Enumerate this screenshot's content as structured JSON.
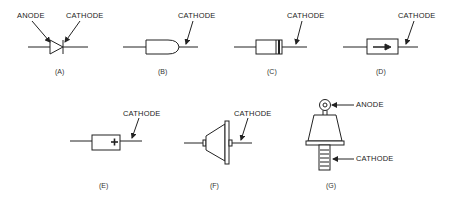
{
  "diagram": {
    "stroke_color": "#222222",
    "figures": [
      {
        "id": "A",
        "caption": "(A)",
        "labels": {
          "anode": "ANODE",
          "cathode": "CATHODE"
        },
        "kind": "schematic-symbol"
      },
      {
        "id": "B",
        "caption": "(B)",
        "labels": {
          "cathode": "CATHODE"
        },
        "kind": "rounded-end-package"
      },
      {
        "id": "C",
        "caption": "(C)",
        "labels": {
          "cathode": "CATHODE"
        },
        "kind": "banded-package"
      },
      {
        "id": "D",
        "caption": "(D)",
        "labels": {
          "cathode": "CATHODE"
        },
        "kind": "arrow-marked-package"
      },
      {
        "id": "E",
        "caption": "(E)",
        "labels": {
          "cathode": "CATHODE"
        },
        "kind": "plus-marked-package"
      },
      {
        "id": "F",
        "caption": "(F)",
        "labels": {
          "cathode": "CATHODE"
        },
        "kind": "flanged-cone-package"
      },
      {
        "id": "G",
        "caption": "(G)",
        "labels": {
          "anode": "ANODE",
          "cathode": "CATHODE"
        },
        "kind": "stud-mount-package"
      }
    ]
  }
}
